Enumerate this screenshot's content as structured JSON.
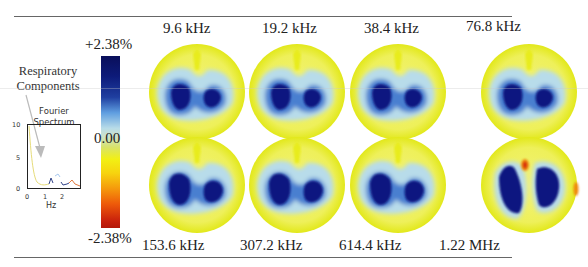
{
  "caption_fragment": "...of propagation ... ... ... ... ...",
  "colorbar": {
    "max_label": "+2.38%",
    "mid_label": "0.00",
    "min_label": "-2.38%"
  },
  "annotation": {
    "line1": "Respiratory",
    "line2": "Components"
  },
  "spectrum": {
    "title_line1": "Fourier",
    "title_line2": "Spectrum",
    "y_ticks": [
      "10",
      "5",
      "0"
    ],
    "x_ticks": [
      "0",
      "1",
      "2"
    ],
    "x_label": "Hz"
  },
  "top_row": [
    {
      "label": "9.6 kHz"
    },
    {
      "label": "19.2 kHz"
    },
    {
      "label": "38.4 kHz"
    },
    {
      "label": "76.8 kHz"
    }
  ],
  "bottom_row": [
    {
      "label": "153.6 kHz"
    },
    {
      "label": "307.2 kHz"
    },
    {
      "label": "614.4 kHz"
    },
    {
      "label": "1.22 MHz"
    }
  ],
  "colors": {
    "yellow": "#e8ec1c",
    "light_yellow": "#f2f27a",
    "light_blue": "#b8dcea",
    "mid_blue": "#4a7fd0",
    "dark_blue": "#0b1680",
    "orange": "#f08a10",
    "red": "#d8300a"
  }
}
